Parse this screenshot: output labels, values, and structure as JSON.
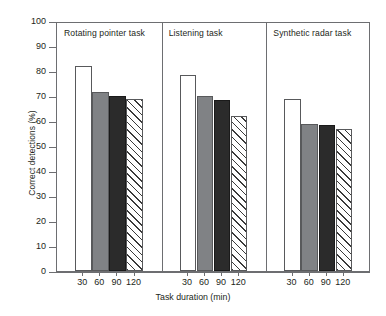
{
  "chart_data": {
    "type": "bar",
    "title": "",
    "xlabel": "Task duration (min)",
    "ylabel": "Correct detections (%)",
    "ylim": [
      0,
      100
    ],
    "ytick_labels": [
      "0",
      "10",
      "20",
      "30",
      "40",
      "50",
      "60",
      "70",
      "80",
      "90",
      "100"
    ],
    "ytick_values": [
      0,
      10,
      20,
      30,
      40,
      50,
      60,
      70,
      80,
      90,
      100
    ],
    "grid": false,
    "legend": "none",
    "categories": [
      "30",
      "60",
      "90",
      "120"
    ],
    "groups": [
      {
        "name": "Rotating pointer task",
        "categories": [
          "30",
          "60",
          "90",
          "120"
        ],
        "values": [
          82,
          71.5,
          70,
          69
        ],
        "fills": [
          "white",
          "gray",
          "dark",
          "hatch"
        ]
      },
      {
        "name": "Listening task",
        "categories": [
          "30",
          "60",
          "90",
          "120"
        ],
        "values": [
          78.5,
          70,
          68.5,
          62
        ],
        "fills": [
          "white",
          "gray",
          "dark",
          "hatch"
        ]
      },
      {
        "name": "Synthetic radar task",
        "categories": [
          "30",
          "60",
          "90",
          "120"
        ],
        "values": [
          69,
          59,
          58.5,
          57
        ],
        "fills": [
          "white",
          "gray",
          "dark",
          "hatch"
        ]
      }
    ],
    "colors": {
      "white_fill": "#ffffff",
      "gray_fill": "#808285",
      "dark_fill": "#2b2b2b",
      "hatch_line": "#3a3a3a",
      "axis": "#6d6e71",
      "text": "#231f20"
    }
  }
}
